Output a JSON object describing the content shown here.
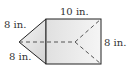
{
  "figure": {
    "type": "triangular-prism",
    "labels": {
      "top_length": "10 in.",
      "left_top_edge": "8 in.",
      "left_bottom_edge": "8 in.",
      "right_height": "8 in."
    },
    "colors": {
      "stroke": "#222222",
      "fill_light": "#f4f4f4",
      "fill_dark": "#cfcfcf",
      "dash": "#555555"
    }
  }
}
